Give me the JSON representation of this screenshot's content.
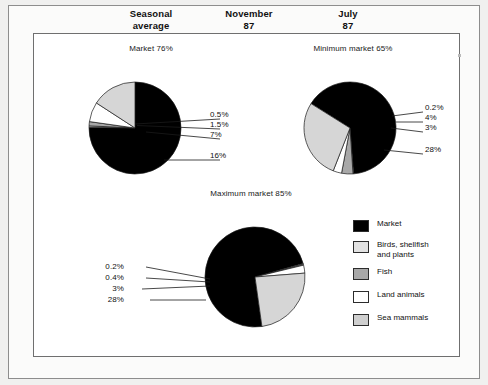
{
  "header": {
    "columns": [
      {
        "line1": "Seasonal",
        "line2": "average"
      },
      {
        "line1": "November",
        "line2": "87"
      },
      {
        "line1": "July",
        "line2": "87"
      }
    ]
  },
  "legend": {
    "items": [
      {
        "label": "Market",
        "color": "#000000"
      },
      {
        "label": "Birds, shellfish and plants",
        "label_line1": "Birds, shellfish",
        "label_line2": "and plants",
        "color": "#e2e2e2"
      },
      {
        "label": "Fish",
        "color": "#a8a8a8"
      },
      {
        "label": "Land animals",
        "color": "#ffffff"
      },
      {
        "label": "Sea mammals",
        "color": "#cfcfcf"
      }
    ]
  },
  "chart_data": [
    {
      "type": "pie",
      "title": "Market 76%",
      "categories": [
        "Market",
        "Birds, shellfish and plants",
        "Fish",
        "Land animals",
        "Sea mammals"
      ],
      "values": [
        76,
        0.5,
        1.5,
        7,
        16
      ],
      "labels": [
        "76%",
        "0.5%",
        "1.5%",
        "7%",
        "16%"
      ],
      "colors": [
        "#000000",
        "#e2e2e2",
        "#a8a8a8",
        "#ffffff",
        "#d6d6d6"
      ],
      "start_angle": 0,
      "callouts": [
        "0.5%",
        "1.5%",
        "7%",
        "16%"
      ]
    },
    {
      "type": "pie",
      "title": "Minimum market 65%",
      "categories": [
        "Market",
        "Birds, shellfish and plants",
        "Fish",
        "Land animals",
        "Sea mammals"
      ],
      "values": [
        65,
        0.2,
        4,
        3,
        28
      ],
      "labels": [
        "65%",
        "0.2%",
        "4%",
        "3%",
        "28%"
      ],
      "colors": [
        "#000000",
        "#e2e2e2",
        "#a8a8a8",
        "#ffffff",
        "#d6d6d6"
      ],
      "start_angle": -58,
      "callouts": [
        "0.2%",
        "4%",
        "3%",
        "28%"
      ]
    },
    {
      "type": "pie",
      "title": "Maximum market 85%",
      "categories": [
        "Market",
        "Birds, shellfish and plants",
        "Fish",
        "Land animals",
        "Sea mammals"
      ],
      "values": [
        85,
        0.2,
        0.4,
        3,
        28
      ],
      "labels": [
        "85%",
        "0.2%",
        "0.4%",
        "3%",
        "28%"
      ],
      "colors": [
        "#000000",
        "#e2e2e2",
        "#a8a8a8",
        "#ffffff",
        "#d6d6d6"
      ],
      "start_angle": 172,
      "callouts": [
        "0.2%",
        "0.4%",
        "3%",
        "28%"
      ]
    }
  ]
}
